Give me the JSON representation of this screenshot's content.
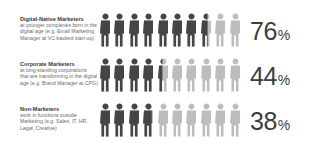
{
  "colors": {
    "filled": "#454545",
    "empty": "#bdbdbd",
    "text": "#3d3d3d",
    "subtext": "#6b6b6b"
  },
  "chart_data": {
    "type": "pictograph",
    "title": "",
    "unit_icons_per_row": 10,
    "categories": [
      "Digital-Native Marketers",
      "Corporate Marketers",
      "Non-Marketers"
    ],
    "values": [
      76,
      44,
      38
    ],
    "value_suffix": "%",
    "descriptions": [
      "at younger companies born in the digital age (e.g. Email Marketing Manager at VC-backed start-up)",
      "at long-standing corporations that are transforming in the digital age (e.g. Brand Manager at CPG)",
      "work in functions outside Marketing (e.g. Sales, IT, HR, Legal, Creative)"
    ]
  },
  "rows": [
    {
      "title": "Digital-Native Marketers",
      "lines": [
        "at younger companies born in the",
        "digital age (e.g. Email Marketing",
        "Manager at VC-backed start-up)"
      ],
      "value": "76",
      "sign": "%",
      "fill": 7.6
    },
    {
      "title": "Corporate Marketers",
      "lines": [
        "at long-standing corporations",
        "that are transforming in the digital",
        "age (e.g. Brand Manager at CPG)"
      ],
      "value": "44",
      "sign": "%",
      "fill": 4.4
    },
    {
      "title": "Non-Marketers",
      "lines": [
        "work in functions outside",
        "Marketing (e.g. Sales, IT, HR,",
        "Legal, Creative)"
      ],
      "value": "38",
      "sign": "%",
      "fill": 3.8
    }
  ]
}
